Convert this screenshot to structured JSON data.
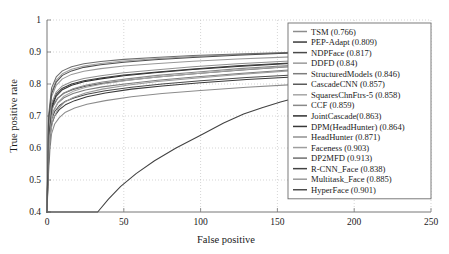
{
  "chart_data": {
    "type": "line",
    "title": "",
    "xlabel": "False positive",
    "ylabel": "True positive rate",
    "xlim": [
      0,
      250
    ],
    "ylim": [
      0.4,
      1.0
    ],
    "xticks": [
      0,
      50,
      100,
      150,
      200,
      250
    ],
    "xtick_labels": [
      "0",
      "50",
      "100",
      "150",
      "200",
      "250"
    ],
    "yticks": [
      0.4,
      0.5,
      0.6,
      0.7,
      0.8,
      0.9,
      1.0
    ],
    "ytick_labels": [
      "0.4",
      "0.5",
      "0.6",
      "0.7",
      "0.8",
      "0.9",
      "1"
    ],
    "grid": true,
    "grid_style": "dotted",
    "legend_position": "right",
    "series": [
      {
        "name": "TSM (0.766)",
        "label": "TSM",
        "score": 0.766,
        "color": "#8c8c8c",
        "x": [
          0,
          1,
          2,
          3,
          5,
          8,
          12,
          18,
          26,
          38,
          55,
          75,
          100,
          130,
          160,
          185
        ],
        "y": [
          0.4,
          0.52,
          0.6,
          0.645,
          0.675,
          0.695,
          0.712,
          0.725,
          0.737,
          0.748,
          0.76,
          0.77,
          0.78,
          0.79,
          0.798,
          0.804
        ]
      },
      {
        "name": "PEP-Adapt (0.809)",
        "label": "PEP-Adapt",
        "score": 0.809,
        "color": "#3a3a3a",
        "x": [
          0,
          1,
          2,
          3,
          5,
          8,
          12,
          18,
          26,
          38,
          55,
          75,
          100,
          130,
          160,
          185
        ],
        "y": [
          0.4,
          0.55,
          0.635,
          0.673,
          0.7,
          0.72,
          0.735,
          0.748,
          0.76,
          0.772,
          0.784,
          0.794,
          0.804,
          0.814,
          0.822,
          0.828
        ]
      },
      {
        "name": "NDPFace (0.817)",
        "label": "NDPFace",
        "score": 0.817,
        "color": "#4a4a4a",
        "x": [
          0,
          1,
          2,
          3,
          5,
          8,
          12,
          18,
          26,
          38,
          55,
          75,
          100,
          130,
          160,
          185
        ],
        "y": [
          0.4,
          0.575,
          0.655,
          0.69,
          0.714,
          0.732,
          0.746,
          0.757,
          0.768,
          0.779,
          0.79,
          0.8,
          0.81,
          0.82,
          0.828,
          0.834
        ]
      },
      {
        "name": "DDFD (0.84)",
        "label": "DDFD",
        "score": 0.84,
        "color": "#9a9a9a",
        "x": [
          0,
          1,
          2,
          4,
          7,
          11,
          17,
          25,
          36,
          52,
          72,
          96,
          125,
          155,
          185
        ],
        "y": [
          0.4,
          0.56,
          0.64,
          0.69,
          0.72,
          0.742,
          0.758,
          0.772,
          0.784,
          0.796,
          0.808,
          0.818,
          0.83,
          0.84,
          0.848
        ]
      },
      {
        "name": "StructuredModels (0.846)",
        "label": "StructuredModels",
        "score": 0.846,
        "color": "#7d7d7d",
        "x": [
          0,
          1,
          2,
          4,
          7,
          11,
          17,
          25,
          36,
          52,
          72,
          96,
          125,
          155,
          185
        ],
        "y": [
          0.4,
          0.6,
          0.672,
          0.714,
          0.74,
          0.757,
          0.77,
          0.781,
          0.791,
          0.801,
          0.812,
          0.822,
          0.833,
          0.843,
          0.851
        ]
      },
      {
        "name": "CascadeCNN (0.857)",
        "label": "CascadeCNN",
        "score": 0.857,
        "color": "#5a5a5a",
        "x": [
          0,
          1,
          2,
          4,
          7,
          11,
          17,
          25,
          36,
          52,
          72,
          96,
          125,
          155,
          185
        ],
        "y": [
          0.4,
          0.62,
          0.695,
          0.733,
          0.756,
          0.771,
          0.783,
          0.793,
          0.802,
          0.812,
          0.822,
          0.832,
          0.843,
          0.853,
          0.86
        ]
      },
      {
        "name": "SquaresChnFtrs-5 (0.858)",
        "label": "SquaresChnFtrs-5",
        "score": 0.858,
        "color": "#a6a6a6",
        "x": [
          0,
          1,
          2,
          4,
          7,
          11,
          17,
          25,
          36,
          52,
          72,
          96,
          125,
          155,
          185
        ],
        "y": [
          0.4,
          0.585,
          0.668,
          0.712,
          0.742,
          0.762,
          0.777,
          0.789,
          0.8,
          0.811,
          0.822,
          0.832,
          0.844,
          0.854,
          0.862
        ]
      },
      {
        "name": "CCF (0.859)",
        "label": "CCF",
        "score": 0.859,
        "color": "#898989",
        "x": [
          0,
          1,
          2,
          4,
          7,
          11,
          17,
          25,
          36,
          52,
          72,
          96,
          125,
          155,
          185
        ],
        "y": [
          0.4,
          0.615,
          0.69,
          0.73,
          0.755,
          0.772,
          0.785,
          0.796,
          0.806,
          0.816,
          0.827,
          0.837,
          0.848,
          0.857,
          0.864
        ]
      },
      {
        "name": "JointCascade(0.863)",
        "label": "JointCascade",
        "score": 0.863,
        "color": "#2f2f2f",
        "x": [
          0,
          1,
          3,
          6,
          10,
          16,
          24,
          35,
          50,
          70,
          95,
          124,
          155,
          185
        ],
        "y": [
          0.4,
          0.64,
          0.725,
          0.762,
          0.782,
          0.796,
          0.807,
          0.816,
          0.826,
          0.835,
          0.845,
          0.855,
          0.863,
          0.869
        ]
      },
      {
        "name": "DPM(HeadHunter) (0.864)",
        "label": "DPM(HeadHunter)",
        "score": 0.864,
        "color": "#383838",
        "x": [
          0,
          1,
          3,
          6,
          10,
          16,
          24,
          35,
          50,
          70,
          95,
          124,
          155,
          185
        ],
        "y": [
          0.4,
          0.65,
          0.732,
          0.768,
          0.787,
          0.8,
          0.81,
          0.819,
          0.828,
          0.837,
          0.847,
          0.857,
          0.865,
          0.871
        ]
      },
      {
        "name": "HeadHunter (0.871)",
        "label": "HeadHunter",
        "score": 0.871,
        "color": "#909090",
        "x": [
          0,
          1,
          3,
          6,
          10,
          16,
          24,
          35,
          50,
          70,
          95,
          124,
          155,
          185
        ],
        "y": [
          0.4,
          0.655,
          0.74,
          0.775,
          0.794,
          0.807,
          0.817,
          0.826,
          0.835,
          0.844,
          0.854,
          0.863,
          0.871,
          0.877
        ]
      },
      {
        "name": "Faceness (0.903)",
        "label": "Faceness",
        "score": 0.903,
        "color": "#9e9e9e",
        "x": [
          0,
          1,
          3,
          6,
          10,
          16,
          24,
          35,
          50,
          70,
          95,
          124,
          155,
          185
        ],
        "y": [
          0.4,
          0.69,
          0.775,
          0.812,
          0.832,
          0.846,
          0.856,
          0.864,
          0.872,
          0.879,
          0.886,
          0.892,
          0.897,
          0.901
        ]
      },
      {
        "name": "DP2MFD (0.913)",
        "label": "DP2MFD",
        "score": 0.913,
        "color": "#6e6e6e",
        "x": [
          0,
          1,
          3,
          6,
          10,
          16,
          24,
          35,
          50,
          70,
          95,
          124,
          155,
          185
        ],
        "y": [
          0.4,
          0.7,
          0.788,
          0.822,
          0.841,
          0.854,
          0.863,
          0.87,
          0.877,
          0.883,
          0.889,
          0.894,
          0.898,
          0.902
        ]
      },
      {
        "name": "R-CNN_Face (0.838)",
        "label": "R-CNN_Face",
        "score": 0.838,
        "color": "#424242",
        "x": [
          0,
          33,
          40,
          48,
          58,
          70,
          84,
          100,
          115,
          128,
          140,
          152,
          163,
          172,
          180,
          185
        ],
        "y": [
          0.4,
          0.4,
          0.44,
          0.48,
          0.52,
          0.56,
          0.6,
          0.64,
          0.678,
          0.706,
          0.726,
          0.744,
          0.758,
          0.768,
          0.775,
          0.778
        ]
      },
      {
        "name": "Multitask_Face (0.885)",
        "label": "Multitask_Face",
        "score": 0.885,
        "color": "#999999",
        "x": [
          0,
          1,
          3,
          6,
          10,
          16,
          24,
          35,
          50,
          70,
          95,
          124,
          155,
          185
        ],
        "y": [
          0.4,
          0.672,
          0.76,
          0.796,
          0.816,
          0.83,
          0.84,
          0.848,
          0.856,
          0.863,
          0.871,
          0.878,
          0.884,
          0.889
        ]
      },
      {
        "name": "HyperFace (0.901)",
        "label": "HyperFace",
        "score": 0.901,
        "color": "#4d4d4d",
        "x": [
          0,
          1,
          3,
          6,
          10,
          16,
          24,
          35,
          50,
          70,
          95,
          124,
          155,
          185
        ],
        "y": [
          0.4,
          0.686,
          0.77,
          0.806,
          0.827,
          0.841,
          0.852,
          0.86,
          0.868,
          0.876,
          0.883,
          0.89,
          0.896,
          0.9
        ]
      }
    ]
  }
}
